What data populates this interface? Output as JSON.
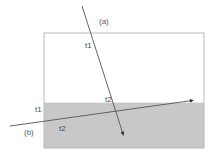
{
  "figure": {
    "type": "ray-refraction-diagram",
    "canvas": {
      "width": 213,
      "height": 156,
      "background": "#ffffff"
    },
    "medium_box": {
      "name": "medium-box",
      "x": 44,
      "y": 33,
      "width": 160,
      "height": 115,
      "stroke": "#b9b9b9",
      "fill": "#ffffff"
    },
    "shaded_medium": {
      "name": "lower-medium",
      "x": 44,
      "y": 103,
      "width": 160,
      "height": 45,
      "fill": "#c8c8c8",
      "interface_y": 103
    },
    "rays": [
      {
        "id": "a",
        "label": "(a)",
        "label_x": 99,
        "label_y": 22,
        "x1": 82,
        "y1": 6,
        "x2": 124,
        "y2": 136,
        "arrow": "end",
        "stroke": "#555555"
      },
      {
        "id": "b",
        "label": "(b)",
        "label_x": 24,
        "label_y": 133,
        "x1": 10,
        "y1": 126,
        "x2": 194,
        "y2": 100,
        "arrow": "end",
        "stroke": "#555555"
      }
    ],
    "segment_labels": [
      {
        "text": "t1",
        "x": 85,
        "y": 46,
        "ray": "a",
        "region": "upper"
      },
      {
        "text": "t2",
        "x": 105,
        "y": 100,
        "ray": "a",
        "region": "near-interface"
      },
      {
        "text": "t1",
        "x": 35,
        "y": 110,
        "ray": "b",
        "region": "outside-left"
      },
      {
        "text": "t2",
        "x": 59,
        "y": 129,
        "ray": "b",
        "region": "lower"
      }
    ],
    "colors": {
      "shade": "#c8c8c8",
      "box_border": "#b9b9b9",
      "ray": "#555555",
      "text": "#4a4a4a"
    }
  }
}
